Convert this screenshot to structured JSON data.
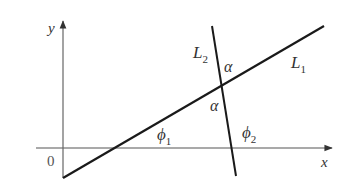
{
  "diagram": {
    "type": "geometry",
    "axes": {
      "x_label": "x",
      "y_label": "y",
      "origin_label": "0"
    },
    "lines": [
      {
        "name": "L1",
        "label_main": "L",
        "label_sub": "1"
      },
      {
        "name": "L2",
        "label_main": "L",
        "label_sub": "2"
      }
    ],
    "angles": {
      "alpha_top": "α",
      "alpha_bottom": "α",
      "phi1_main": "ϕ",
      "phi1_sub": "1",
      "phi2_main": "ϕ",
      "phi2_sub": "2"
    },
    "colors": {
      "axis": "#555555",
      "line": "#1a1a1a",
      "text": "#333333"
    }
  }
}
